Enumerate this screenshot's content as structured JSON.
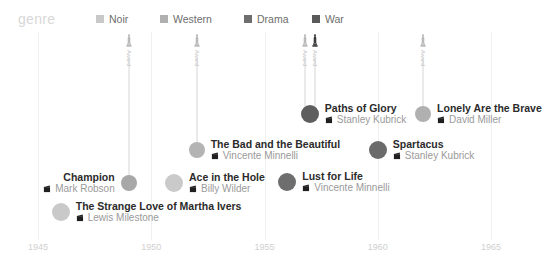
{
  "legend": {
    "title": "genre",
    "items": [
      {
        "label": "Noir",
        "color": "#c9c9c9",
        "x": 96
      },
      {
        "label": "Western",
        "color": "#b0b0b0",
        "x": 160
      },
      {
        "label": "Drama",
        "color": "#6e6e6e",
        "x": 244
      },
      {
        "label": "War",
        "color": "#5a5a5a",
        "x": 312
      }
    ]
  },
  "chart_data": {
    "type": "scatter",
    "title": "",
    "xlabel": "",
    "ylabel": "",
    "xlim": [
      1944.2,
      1966.5
    ],
    "grid": true,
    "legend_position": "top",
    "categories": [
      "Noir",
      "Western",
      "Drama",
      "War"
    ],
    "tick_labels": [
      "1945",
      "1950",
      "1955",
      "1960",
      "1965"
    ],
    "ticks": [
      1945,
      1950,
      1955,
      1960,
      1965
    ],
    "points": [
      {
        "title": "The Strange Love of Martha Ivers",
        "director": "Lewis Milestone",
        "year": 1946,
        "genre": "Noir",
        "color": "#c9c9c9",
        "radius": 9,
        "label_side": "right",
        "awards": []
      },
      {
        "title": "Champion",
        "director": "Mark Robson",
        "year": 1949,
        "genre": "Drama",
        "color": "#a8a8a8",
        "radius": 8,
        "label_side": "left",
        "awards": [
          "Award"
        ]
      },
      {
        "title": "Ace in the Hole",
        "director": "Billy Wilder",
        "year": 1951,
        "genre": "Noir",
        "color": "#cacaca",
        "radius": 9,
        "label_side": "right",
        "awards": []
      },
      {
        "title": "The Bad and the Beautiful",
        "director": "Vincente Minnelli",
        "year": 1952,
        "genre": "Drama",
        "color": "#b4b4b4",
        "radius": 8,
        "label_side": "right",
        "awards": [
          "Award"
        ]
      },
      {
        "title": "Lust for Life",
        "director": "Vincente Minnelli",
        "year": 1956,
        "genre": "Drama",
        "color": "#6e6e6e",
        "radius": 9,
        "label_side": "right",
        "awards": []
      },
      {
        "title": "Paths of Glory",
        "director": "Stanley Kubrick",
        "year": 1957,
        "genre": "War",
        "color": "#5e5e5e",
        "radius": 9,
        "label_side": "right",
        "awards": [
          "Award",
          "Award"
        ]
      },
      {
        "title": "Spartacus",
        "director": "Stanley Kubrick",
        "year": 1960,
        "genre": "Drama",
        "color": "#6b6b6b",
        "radius": 9,
        "label_side": "right",
        "awards": []
      },
      {
        "title": "Lonely Are the Brave",
        "director": "David Miller",
        "year": 1962,
        "genre": "Western",
        "color": "#b0b0b0",
        "radius": 8,
        "label_side": "right",
        "awards": [
          "Award"
        ]
      }
    ]
  }
}
